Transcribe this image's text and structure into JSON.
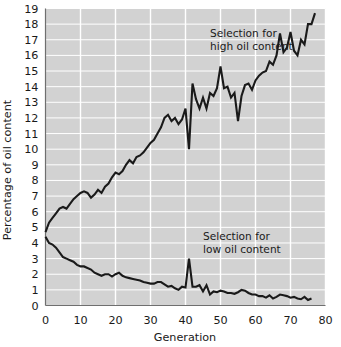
{
  "chart_data": {
    "type": "line",
    "title": "",
    "xlabel": "Generation",
    "ylabel": "Percentage of oil content",
    "xlim": [
      0,
      80
    ],
    "ylim": [
      0,
      19
    ],
    "xticks": [
      0,
      10,
      20,
      30,
      40,
      50,
      60,
      70,
      80
    ],
    "yticks": [
      0,
      1,
      2,
      3,
      4,
      5,
      6,
      7,
      8,
      9,
      10,
      11,
      12,
      13,
      14,
      15,
      16,
      17,
      18,
      19
    ],
    "grid": true,
    "grid_color": "#ffffff",
    "plot_background": "#d2d2d2",
    "line_color": "#1a1a1a",
    "legend_position": "inline-annotations",
    "annotations": [
      {
        "name": "high-selection-label",
        "lines": [
          "Selection for",
          "high oil content"
        ],
        "x": 47,
        "y": 17.2
      },
      {
        "name": "low-selection-label",
        "lines": [
          "Selection for",
          "low oil content"
        ],
        "x": 45,
        "y": 4.2
      }
    ],
    "series": [
      {
        "name": "Selection for high oil content",
        "color": "#1a1a1a",
        "x": [
          0,
          1,
          2,
          3,
          4,
          5,
          6,
          7,
          8,
          9,
          10,
          11,
          12,
          13,
          14,
          15,
          16,
          17,
          18,
          19,
          20,
          21,
          22,
          23,
          24,
          25,
          26,
          27,
          28,
          29,
          30,
          31,
          32,
          33,
          34,
          35,
          36,
          37,
          38,
          39,
          40,
          41,
          42,
          43,
          44,
          45,
          46,
          47,
          48,
          49,
          50,
          51,
          52,
          53,
          54,
          55,
          56,
          57,
          58,
          59,
          60,
          61,
          62,
          63,
          64,
          65,
          66,
          67,
          68,
          69,
          70,
          71,
          72,
          73,
          74,
          75,
          76,
          77
        ],
        "values": [
          4.7,
          5.3,
          5.6,
          5.9,
          6.2,
          6.3,
          6.2,
          6.5,
          6.8,
          7.0,
          7.2,
          7.3,
          7.2,
          6.9,
          7.1,
          7.4,
          7.2,
          7.6,
          7.8,
          8.2,
          8.5,
          8.4,
          8.6,
          9.0,
          9.3,
          9.1,
          9.5,
          9.6,
          9.8,
          10.1,
          10.4,
          10.6,
          11.0,
          11.4,
          12.0,
          12.2,
          11.8,
          12.0,
          11.6,
          11.9,
          12.6,
          10.0,
          14.2,
          13.2,
          12.6,
          13.3,
          12.6,
          13.6,
          13.4,
          13.9,
          15.3,
          13.9,
          14.0,
          13.3,
          13.6,
          11.8,
          13.4,
          14.1,
          14.2,
          13.8,
          14.4,
          14.7,
          14.9,
          15.0,
          15.6,
          15.4,
          16.0,
          17.4,
          16.2,
          16.5,
          17.5,
          16.3,
          16.0,
          17.0,
          16.7,
          18.0,
          18.0,
          18.7
        ]
      },
      {
        "name": "Selection for low oil content",
        "color": "#1a1a1a",
        "x": [
          0,
          1,
          2,
          3,
          4,
          5,
          6,
          7,
          8,
          9,
          10,
          11,
          12,
          13,
          14,
          15,
          16,
          17,
          18,
          19,
          20,
          21,
          22,
          23,
          24,
          25,
          26,
          27,
          28,
          29,
          30,
          31,
          32,
          33,
          34,
          35,
          36,
          37,
          38,
          39,
          40,
          41,
          42,
          43,
          44,
          45,
          46,
          47,
          48,
          49,
          50,
          51,
          52,
          53,
          54,
          55,
          56,
          57,
          58,
          59,
          60,
          61,
          62,
          63,
          64,
          65,
          66,
          67,
          68,
          69,
          70,
          71,
          72,
          73,
          74,
          75,
          76
        ],
        "values": [
          4.4,
          4.0,
          3.9,
          3.7,
          3.4,
          3.1,
          3.0,
          2.9,
          2.8,
          2.6,
          2.5,
          2.5,
          2.4,
          2.3,
          2.1,
          2.0,
          1.9,
          2.0,
          2.0,
          1.85,
          2.0,
          2.1,
          1.9,
          1.8,
          1.75,
          1.7,
          1.65,
          1.6,
          1.5,
          1.45,
          1.4,
          1.4,
          1.5,
          1.5,
          1.35,
          1.2,
          1.25,
          1.1,
          1.0,
          1.2,
          1.15,
          3.0,
          1.2,
          1.2,
          1.3,
          0.9,
          1.3,
          0.7,
          0.9,
          0.85,
          0.95,
          0.9,
          0.8,
          0.8,
          0.75,
          0.85,
          1.0,
          0.95,
          0.8,
          0.7,
          0.7,
          0.6,
          0.6,
          0.5,
          0.65,
          0.45,
          0.55,
          0.7,
          0.65,
          0.6,
          0.5,
          0.55,
          0.45,
          0.4,
          0.55,
          0.35,
          0.45
        ]
      }
    ]
  }
}
